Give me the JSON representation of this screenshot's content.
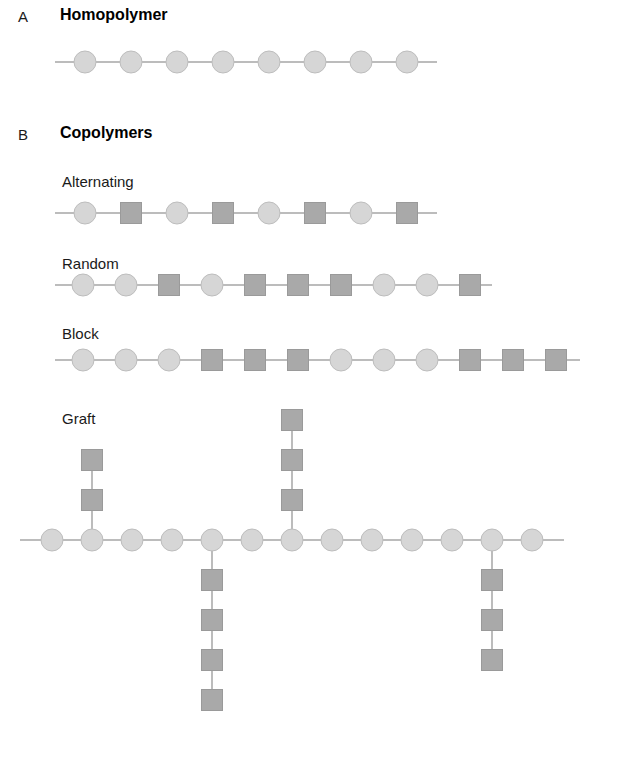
{
  "figure": {
    "background_color": "#ffffff",
    "circle_fill": "#d6d6d6",
    "circle_stroke": "#bdbdbd",
    "square_fill": "#a9a9a9",
    "square_stroke": "#9a9a9a",
    "bond_color": "#bcbcbc",
    "text_color": "#1a1a1a"
  },
  "panels": {
    "a": {
      "letter": "A",
      "title": "Homopolymer",
      "chain": {
        "units": [
          "circle",
          "circle",
          "circle",
          "circle",
          "circle",
          "circle",
          "circle",
          "circle"
        ],
        "unit_count": 8,
        "spacing": 46,
        "lead_in": 30,
        "lead_out": 30
      }
    },
    "b": {
      "letter": "B",
      "title": "Copolymers",
      "rows": [
        {
          "label": "Alternating",
          "units": [
            "circle",
            "square",
            "circle",
            "square",
            "circle",
            "square",
            "circle",
            "square"
          ],
          "unit_count": 8,
          "spacing": 46,
          "lead_in": 30,
          "lead_out": 30
        },
        {
          "label": "Random",
          "units": [
            "circle",
            "circle",
            "square",
            "circle",
            "square",
            "square",
            "square",
            "circle",
            "circle",
            "square"
          ],
          "unit_count": 10,
          "spacing": 43,
          "lead_in": 28,
          "lead_out": 22
        },
        {
          "label": "Block",
          "units": [
            "circle",
            "circle",
            "circle",
            "square",
            "square",
            "square",
            "circle",
            "circle",
            "circle",
            "square",
            "square",
            "square"
          ],
          "unit_count": 12,
          "spacing": 43,
          "lead_in": 28,
          "lead_out": 24
        }
      ],
      "graft": {
        "label": "Graft",
        "backbone_units": [
          "circle",
          "circle",
          "circle",
          "circle",
          "circle",
          "circle",
          "circle",
          "circle",
          "circle",
          "circle",
          "circle",
          "circle",
          "circle"
        ],
        "backbone_count": 13,
        "spacing": 40,
        "lead_in": 32,
        "lead_out": 32,
        "branches": [
          {
            "attach_index": 1,
            "direction": "up",
            "unit_type": "square",
            "length": 2
          },
          {
            "attach_index": 4,
            "direction": "down",
            "unit_type": "square",
            "length": 4
          },
          {
            "attach_index": 6,
            "direction": "up",
            "unit_type": "square",
            "length": 3
          },
          {
            "attach_index": 11,
            "direction": "down",
            "unit_type": "square",
            "length": 3
          }
        ]
      }
    }
  }
}
